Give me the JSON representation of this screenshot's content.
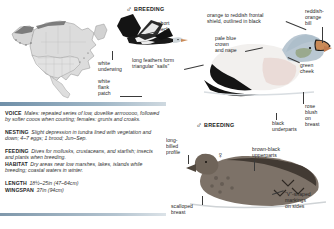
{
  "page": {
    "width": 334,
    "height": 229,
    "background": "#ffffff"
  },
  "plates": {
    "flying_male": {
      "sex_symbol": "♂",
      "status_label": "BREEDING"
    },
    "swimming_male": {
      "sex_symbol": "♂",
      "status_label": "BREEDING"
    },
    "female": {
      "sex_symbol": "♀"
    }
  },
  "callouts": [
    {
      "id": "short-neck",
      "text": "short\nneck"
    },
    {
      "id": "white-underwing",
      "text": "white\nunderwing"
    },
    {
      "id": "white-flank-patch",
      "text": "white\nflank\npatch"
    },
    {
      "id": "long-feathers-sails",
      "text": "long feathers form\ntriangular “sails”"
    },
    {
      "id": "frontal-shield",
      "text": "orange to reddish frontal\nshield, outlined in black"
    },
    {
      "id": "reddish-orange-bill",
      "text": "reddish-\norange\nbill"
    },
    {
      "id": "pale-blue-crown",
      "text": "pale blue\ncrown\nand nape"
    },
    {
      "id": "green-cheek",
      "text": "green\ncheek"
    },
    {
      "id": "rose-blush-breast",
      "text": "rose\nblush\non\nbreast"
    },
    {
      "id": "black-underparts",
      "text": "black\nunderparts"
    },
    {
      "id": "long-billed-profile",
      "text": "long-\nbilled\nprofile"
    },
    {
      "id": "brown-black-upperparts",
      "text": "brown-black\nupperparts"
    },
    {
      "id": "v-shaped-markings",
      "text": "“V”-shaped\nmarkings\non sides"
    },
    {
      "id": "scalloped-breast",
      "text": "scalloped\nbreast"
    }
  ],
  "info": {
    "rows": [
      {
        "key": "VOICE",
        "value": "Males: repeated series of low, dovelike arrrooooo, followed by softer cooos when courting; females: grunts and croaks."
      },
      {
        "key": "NESTING",
        "value": "Slight depression in tundra lined with vegetation and down; 4–7 eggs; 1 brood; Jun–Sep."
      },
      {
        "key": "FEEDING",
        "value": "Dives for mollusks, crustaceans, and starfish; insects and plants when breeding."
      },
      {
        "key": "HABITAT",
        "value": "Dry areas near low marshes, lakes, islands while breeding; coastal waters in winter."
      },
      {
        "key": "LENGTH",
        "value": "18½–25in (47–64cm)"
      },
      {
        "key": "WINGSPAN",
        "value": "37in (94cm)"
      }
    ]
  },
  "colors": {
    "rule_bar": "#6f8fa8",
    "text": "#262626",
    "leader_line": "#3a3a3a",
    "map_land": "#d9d9d9",
    "map_outline": "#8a8a8a",
    "plumage_black": "#111111",
    "plumage_white": "#f4f4f4",
    "bill_orange": "#c98a58",
    "crown_blue": "#aebfcb",
    "cheek_green": "#9aa98e",
    "female_brown": "#7d7268"
  }
}
